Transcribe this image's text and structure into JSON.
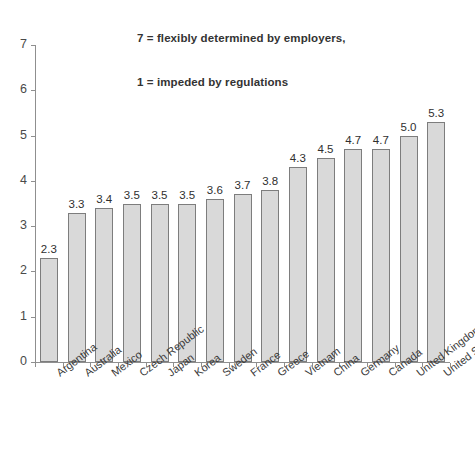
{
  "chart_data": {
    "type": "bar",
    "title": "7 = flexibly determined by employers,\n1 = impeded by regulations",
    "title_lines": [
      "7 = flexibly determined by employers,",
      "1 = impeded by regulations"
    ],
    "xlabel": "",
    "ylabel": "",
    "ylim": [
      0,
      7
    ],
    "y_ticks": [
      0,
      1,
      2,
      3,
      4,
      5,
      6,
      7
    ],
    "grid": false,
    "legend": "none",
    "bar_fill_color": "#d9d9d9",
    "bar_border_color": "#7d7d7d",
    "categories": [
      "Argentina",
      "Australia",
      "Mexico",
      "Czech Republic",
      "Japan",
      "Korea",
      "Sweden",
      "France",
      "Greece",
      "Vietnam",
      "China",
      "Germany",
      "Canada",
      "United Kingdom",
      "United States"
    ],
    "values": [
      2.3,
      3.3,
      3.4,
      3.5,
      3.5,
      3.5,
      3.6,
      3.7,
      3.8,
      4.3,
      4.5,
      4.7,
      4.7,
      5.0,
      5.3
    ],
    "value_labels": [
      "2.3",
      "3.3",
      "3.4",
      "3.5",
      "3.5",
      "3.5",
      "3.6",
      "3.7",
      "3.8",
      "4.3",
      "4.5",
      "4.7",
      "4.7",
      "5.0",
      "5.3"
    ]
  }
}
